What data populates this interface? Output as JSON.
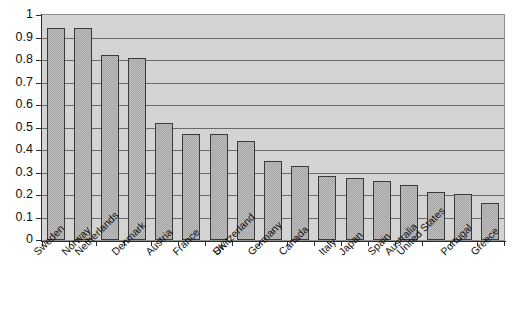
{
  "chart_data": {
    "type": "bar",
    "title": "",
    "subtitle": "",
    "xlabel": "",
    "ylabel": "",
    "ylim": [
      0,
      1
    ],
    "ytick_step": 0.1,
    "grid": true,
    "legend": false,
    "categories": [
      "Sweden",
      "Norway",
      "Netherlands",
      "Denmark",
      "Austria",
      "France",
      "UK",
      "Switzerland",
      "Germany",
      "Canada",
      "Italy",
      "Japan",
      "Spain",
      "Australia",
      "United States",
      "Portugal",
      "Greece"
    ],
    "values": [
      0.94,
      0.94,
      0.82,
      0.81,
      0.52,
      0.47,
      0.47,
      0.44,
      0.35,
      0.33,
      0.285,
      0.275,
      0.26,
      0.245,
      0.215,
      0.205,
      0.165
    ],
    "ytick_labels": [
      "0",
      "0.1",
      "0.2",
      "0.3",
      "0.4",
      "0.5",
      "0.6",
      "0.7",
      "0.8",
      "0.9",
      "1"
    ],
    "ytick_values": [
      0,
      0.1,
      0.2,
      0.3,
      0.4,
      0.5,
      0.6,
      0.7,
      0.8,
      0.9,
      1
    ],
    "colors": {
      "bar_fill": "#bdbdbd",
      "bar_border": "#3a3a3a",
      "plot_background": "#d8d8d8",
      "gridline": "#6b6b6b",
      "axis": "#2b2b2b",
      "text": "#111111",
      "page_background": "#ffffff"
    },
    "label_rotation_degrees": -45
  }
}
